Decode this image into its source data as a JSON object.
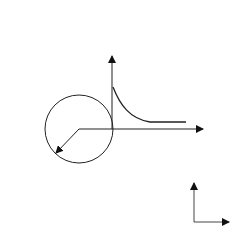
{
  "diagram": {
    "title": "",
    "colors": {
      "stroke": "#222222",
      "label": "#555555",
      "arrow": "#444444"
    },
    "top_load": {
      "direction": "up",
      "arrow_x": [
        20,
        47,
        73,
        100,
        127,
        154
      ],
      "label": "σ",
      "label_sub": "0"
    },
    "bottom_load": {
      "direction": "down",
      "arrow_x": [
        21,
        47,
        74,
        101,
        128,
        155
      ],
      "label": "σ",
      "label_sub": "0"
    },
    "hole": {
      "radius_label": "a"
    },
    "stress_plot": {
      "vertical_axis_label": "σ",
      "peak_label": "3σ",
      "peak_label_sub": "0",
      "horizontal_axis_label": "x"
    },
    "coordinate_frame": {
      "x_label": "x",
      "y_label": "y"
    }
  }
}
